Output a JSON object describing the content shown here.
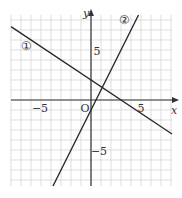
{
  "chart_data": {
    "type": "line",
    "title": "",
    "xlabel": "x",
    "ylabel": "y",
    "origin_label": "O",
    "xlim": [
      -8,
      8
    ],
    "ylim": [
      -8.6,
      8.5
    ],
    "grid": true,
    "x_ticks_labeled": [
      {
        "value": -5,
        "label": "−5"
      },
      {
        "value": 5,
        "label": "5"
      }
    ],
    "y_ticks_labeled": [
      {
        "value": 5,
        "label": "5"
      },
      {
        "value": -5,
        "label": "−5"
      }
    ],
    "series": [
      {
        "name": "①",
        "label": "①",
        "equation": "y = -2/3 x + 2",
        "slope": -0.6667,
        "intercept": 2,
        "x": [
          -8,
          8
        ],
        "y": [
          7.333,
          -3.333
        ]
      },
      {
        "name": "②",
        "label": "②",
        "equation": "y = 2x - 1",
        "slope": 2,
        "intercept": -1,
        "x": [
          -3.8,
          4.75
        ],
        "y": [
          -8.6,
          8.5
        ]
      }
    ],
    "intersection": {
      "x": 1.125,
      "y": 1.25
    }
  }
}
